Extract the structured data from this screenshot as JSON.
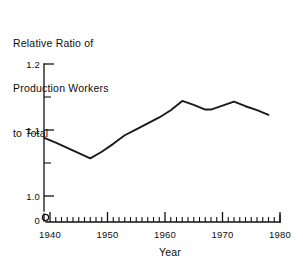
{
  "chart_data": {
    "type": "line",
    "title": "Relative Ratio of Production Workers to Total",
    "title_lines": [
      "Relative Ratio of",
      "Production Workers",
      "to Total"
    ],
    "xlabel": "Year",
    "ylabel": "",
    "xlim": [
      1937,
      1980
    ],
    "ylim": [
      1.0,
      1.2
    ],
    "y_axis_broken": true,
    "y_break_label": "0",
    "grid": false,
    "legend": null,
    "x_ticks_major": [
      1940,
      1950,
      1960,
      1970,
      1980
    ],
    "x_tick_labels": [
      "1940",
      "1950",
      "1960",
      "1970",
      "1980"
    ],
    "x_ticks_minor_step": 1,
    "y_ticks_major": [
      1.0,
      1.1,
      1.2
    ],
    "y_tick_labels": [
      "1.0",
      "1.1",
      "1.2"
    ],
    "y_ticks_minor": [
      1.05,
      1.15
    ],
    "x": [
      1939,
      1941,
      1943,
      1945,
      1947,
      1949,
      1951,
      1953,
      1955,
      1957,
      1959,
      1961,
      1963,
      1965,
      1967,
      1968,
      1970,
      1972,
      1974,
      1976,
      1978
    ],
    "values": [
      1.088,
      1.081,
      1.073,
      1.065,
      1.057,
      1.067,
      1.079,
      1.092,
      1.101,
      1.11,
      1.119,
      1.13,
      1.144,
      1.138,
      1.131,
      1.131,
      1.137,
      1.143,
      1.136,
      1.13,
      1.123
    ],
    "series": [
      {
        "name": "Relative ratio of production workers to total",
        "values": [
          1.088,
          1.081,
          1.073,
          1.065,
          1.057,
          1.067,
          1.079,
          1.092,
          1.101,
          1.11,
          1.119,
          1.13,
          1.144,
          1.138,
          1.131,
          1.131,
          1.137,
          1.143,
          1.136,
          1.13,
          1.123
        ],
        "color": "#1a1a1a"
      }
    ],
    "annotations": []
  },
  "axis": {
    "y_label_top": "1.2",
    "y_label_mid": "1.1",
    "y_label_bottom": "1.0",
    "y_label_zero": "0",
    "x_label_1940": "1940",
    "x_label_1950": "1950",
    "x_label_1960": "1960",
    "x_label_1970": "1970",
    "x_label_1980": "1980",
    "x_axis_title": "Year"
  },
  "colors": {
    "background": "#ffffff",
    "ink": "#111111",
    "line": "#1a1a1a"
  }
}
